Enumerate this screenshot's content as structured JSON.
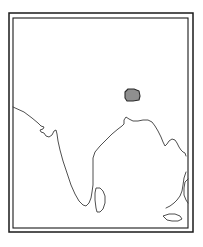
{
  "figure": {
    "kind": "map-figure",
    "width": 203,
    "height": 247,
    "background_color": "#ffffff",
    "title": "",
    "caption": ""
  },
  "frame": {
    "name": "double-line-map-border",
    "stroke_color": "#1a1a1a",
    "outer": {
      "x": 9,
      "y": 13,
      "width": 184,
      "height": 219
    },
    "inner": {
      "x": 13,
      "y": 18,
      "width": 175,
      "height": 210
    }
  },
  "map": {
    "region_name": "Indian subcontinent",
    "sea_color": "#ffffff",
    "land_color": "#ffffff",
    "coast_stroke_color": "#3b3b3b",
    "features": [
      {
        "name": "mainland-coastline",
        "label": "India mainland coastline",
        "path": "M 13,107 L 24,112 L 32,118 L 38,123 L 41,126 L 44,127 L 43,129 L 40,130 L 41,132 L 44,133 L 46,136 L 49,137 L 52,135 L 54,131 L 56,130 L 57,134 L 58,141 L 60,150 L 63,161 L 67,173 L 71,185 L 75,194 L 79,201 L 83,205 L 86,206 L 89,203 L 91,198 L 92,192 L 93,185 L 93,176 L 93,167 L 93,158 L 95,152 L 100,146 L 106,140 L 112,134 L 118,129 L 122,126 L 124,124 L 124,120 L 126,117 L 129,119 L 133,121 L 138,121 L 143,120 L 148,120 L 152,122 L 155,126 L 158,131 L 161,137 L 163,142 L 165,146 L 167,144 L 169,141 L 172,139 L 175,140 L 177,143 L 179,147 L 181,150 L 183,152 L 185,153 L 186,156"
      },
      {
        "name": "sri-lanka-island",
        "label": "Sri Lanka",
        "path": "M 96,188 L 100,188 L 103,191 L 105,196 L 105,203 L 103,209 L 100,212 L 97,212 L 96,208 L 95,200 L 95,193 Z"
      },
      {
        "name": "myanmar-coast",
        "label": "Myanmar / Andaman coast",
        "path": "M 186,172 L 184,178 L 183,185 L 182,191 L 180,196 L 177,200 L 174,203 L 170,206 L 166,208"
      },
      {
        "name": "east-coast-inlet",
        "label": "Eastern coastal inlet",
        "path": "M 188,179 L 185,182 L 184,188 L 184,195 L 186,200 L 188,203"
      },
      {
        "name": "southern-island-sliver",
        "label": "Southern island",
        "path": "M 163,216 L 169,214 L 175,214 L 180,216 L 182,219 L 178,221 L 172,221 L 167,220 Z"
      }
    ],
    "highlight": {
      "name": "shaded-study-area",
      "label": "",
      "fill_color": "#8f8f8f",
      "stroke_color": "#2a2a2a",
      "path": "M 125,92 L 128,89 L 134,89 L 139,91 L 140,96 L 139,100 L 133,101 L 127,101 L 125,98 Z",
      "centroid": {
        "x": 132,
        "y": 95
      }
    }
  },
  "legend": {
    "visible": false,
    "items": []
  },
  "axes": {
    "visible": false,
    "x_ticks": [],
    "y_ticks": []
  }
}
